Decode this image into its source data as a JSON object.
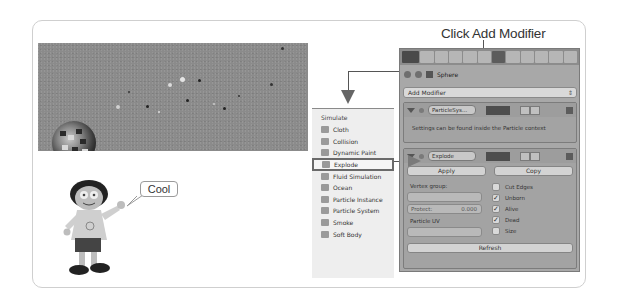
{
  "annotation": {
    "caption": "Click Add Modifier",
    "speech_bubble": "Cool"
  },
  "viewport": {
    "object": "Sphere"
  },
  "properties_panel": {
    "context_object": "Sphere",
    "add_modifier_label": "Add Modifier",
    "modifiers": [
      {
        "name": "ParticleSys...",
        "info": "Settings can be found inside the Particle context"
      },
      {
        "name": "Explode",
        "apply_label": "Apply",
        "copy_label": "Copy",
        "vertex_group_label": "Vertex group:",
        "vertex_group_value": "",
        "protect_label": "Protect:",
        "protect_value": "0.000",
        "particle_uv_label": "Particle UV",
        "particle_uv_value": "",
        "checkboxes": [
          {
            "label": "Cut Edges",
            "checked": false
          },
          {
            "label": "Unborn",
            "checked": true
          },
          {
            "label": "Alive",
            "checked": true
          },
          {
            "label": "Dead",
            "checked": true
          },
          {
            "label": "Size",
            "checked": false
          }
        ],
        "refresh_label": "Refresh"
      }
    ]
  },
  "menu": {
    "heading": "Simulate",
    "items": [
      {
        "label": "Cloth",
        "icon": "cloth-icon"
      },
      {
        "label": "Collision",
        "icon": "collision-icon"
      },
      {
        "label": "Dynamic Paint",
        "icon": "dynamic-paint-icon"
      },
      {
        "label": "Explode",
        "icon": "explode-icon",
        "highlighted": true
      },
      {
        "label": "Fluid Simulation",
        "icon": "fluid-icon"
      },
      {
        "label": "Ocean",
        "icon": "ocean-icon"
      },
      {
        "label": "Particle Instance",
        "icon": "particle-instance-icon"
      },
      {
        "label": "Particle System",
        "icon": "particle-system-icon"
      },
      {
        "label": "Smoke",
        "icon": "smoke-icon"
      },
      {
        "label": "Soft Body",
        "icon": "soft-body-icon"
      }
    ]
  }
}
